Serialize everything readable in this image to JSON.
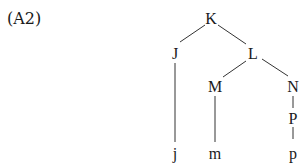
{
  "example_label": "(A2)",
  "tree": {
    "nodes": [
      {
        "id": "K",
        "label": "K",
        "x": 211,
        "y": 18
      },
      {
        "id": "J",
        "label": "J",
        "x": 175,
        "y": 53
      },
      {
        "id": "L",
        "label": "L",
        "x": 253,
        "y": 53
      },
      {
        "id": "M",
        "label": "M",
        "x": 215,
        "y": 86
      },
      {
        "id": "N",
        "label": "N",
        "x": 293,
        "y": 86
      },
      {
        "id": "P",
        "label": "P",
        "x": 293,
        "y": 118
      },
      {
        "id": "j",
        "label": "j",
        "x": 175,
        "y": 153
      },
      {
        "id": "m",
        "label": "m",
        "x": 215,
        "y": 153
      },
      {
        "id": "p",
        "label": "p",
        "x": 293,
        "y": 153
      }
    ],
    "edges": [
      {
        "from": "K",
        "to": "J"
      },
      {
        "from": "K",
        "to": "L"
      },
      {
        "from": "L",
        "to": "M"
      },
      {
        "from": "L",
        "to": "N"
      },
      {
        "from": "J",
        "to": "j"
      },
      {
        "from": "M",
        "to": "m"
      },
      {
        "from": "N",
        "to": "P"
      },
      {
        "from": "P",
        "to": "p"
      }
    ]
  }
}
